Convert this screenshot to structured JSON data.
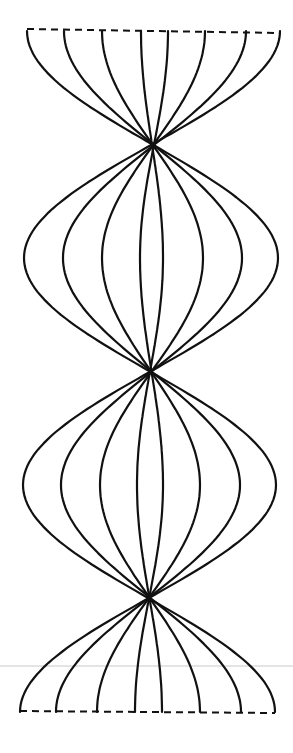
{
  "diagram": {
    "type": "braided-strand-pattern",
    "strand_count": 8,
    "stroke_color": "#111111",
    "background": "#ffffff",
    "top_edge": {
      "y1": 29,
      "y2": 33,
      "x_left": 27,
      "x_right": 280,
      "style": "dashed"
    },
    "bottom_edge": {
      "y1": 711,
      "y2": 713,
      "x_left": 20,
      "x_right": 275,
      "style": "dashed"
    },
    "top_endpoints_x": [
      27,
      64,
      102,
      141,
      168,
      205,
      246,
      280
    ],
    "bottom_endpoints_x": [
      20,
      56,
      97,
      135,
      162,
      200,
      241,
      275
    ],
    "levels": [
      {
        "name": "top",
        "y": 31
      },
      {
        "name": "lens-1",
        "y": 258,
        "x": [
          24,
          63,
          102,
          140,
          163,
          203,
          242,
          278
        ]
      },
      {
        "name": "lens-2",
        "y": 485,
        "x": [
          23,
          61,
          100,
          137,
          163,
          200,
          240,
          276
        ]
      },
      {
        "name": "bottom",
        "y": 712
      }
    ],
    "center_x": 151,
    "crossing_points_center_y": [
      70,
      218,
      298,
      365,
      445,
      523,
      640
    ]
  }
}
